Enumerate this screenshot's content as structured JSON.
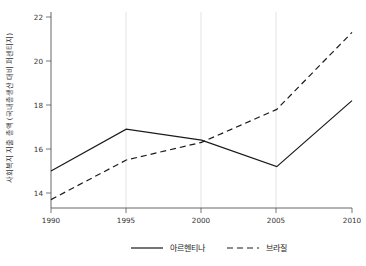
{
  "chart_data": {
    "type": "line",
    "title": "",
    "xlabel": "",
    "ylabel": "사회복지 지출 총액 (국내총생산 대비 퍼센티지)",
    "x": [
      1990,
      1995,
      2000,
      2005,
      2010
    ],
    "xticklabels": [
      "1990",
      "1995",
      "2000",
      "2005",
      "2010"
    ],
    "yticklabels": [
      "14",
      "16",
      "18",
      "20",
      "22"
    ],
    "yticks": [
      14,
      16,
      18,
      20,
      22
    ],
    "xlim": [
      1990,
      2010
    ],
    "ylim": [
      13.4,
      22.3
    ],
    "grid": "vertical-minor",
    "legend_position": "bottom",
    "series": [
      {
        "name": "아르헨티나",
        "style": "solid",
        "color": "#1a1a1a",
        "values": [
          15.0,
          16.9,
          16.4,
          15.2,
          18.2
        ]
      },
      {
        "name": "브라질",
        "style": "dashed",
        "color": "#1a1a1a",
        "values": [
          13.7,
          15.5,
          16.3,
          17.8,
          21.3
        ]
      }
    ]
  },
  "legend": {
    "items": [
      {
        "label": "아르헨티나",
        "style": "solid"
      },
      {
        "label": "브라질",
        "style": "dashed"
      }
    ]
  },
  "axes": {
    "y_title": "사회복지 지출 총액 (국내총생산 대비 퍼센티지)"
  }
}
